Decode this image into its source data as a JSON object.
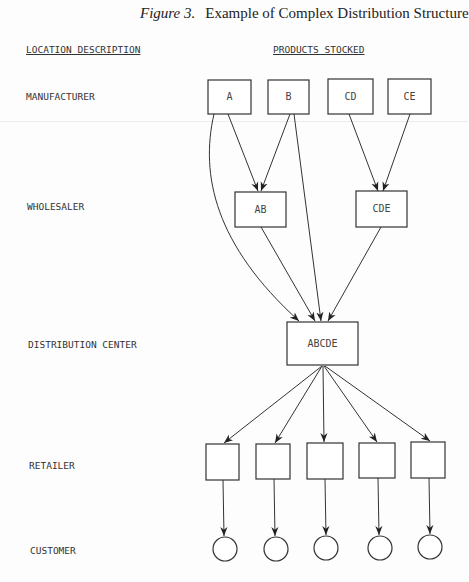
{
  "title": {
    "figure_label": "Figure 3.",
    "text": "Example of Complex Distribution Structure"
  },
  "headers": {
    "location": "LOCATION DESCRIPTION",
    "products": "PRODUCTS STOCKED"
  },
  "levels": [
    {
      "id": "manufacturer",
      "label": "MANUFACTURER"
    },
    {
      "id": "wholesaler",
      "label": "WHOLESALER"
    },
    {
      "id": "distribution_center",
      "label": "DISTRIBUTION CENTER"
    },
    {
      "id": "retailer",
      "label": "RETAILER"
    },
    {
      "id": "customer",
      "label": "CUSTOMER"
    }
  ],
  "nodes": {
    "manufacturers": [
      {
        "id": "A",
        "label": "A"
      },
      {
        "id": "B",
        "label": "B"
      },
      {
        "id": "CD",
        "label": "CD"
      },
      {
        "id": "CE",
        "label": "CE"
      }
    ],
    "wholesalers": [
      {
        "id": "AB",
        "label": "AB"
      },
      {
        "id": "CDE",
        "label": "CDE"
      }
    ],
    "distribution_center": {
      "id": "ABCDE",
      "label": "ABCDE"
    },
    "retailers_count": 5,
    "customers_count": 5
  },
  "edges": [
    [
      "A",
      "AB"
    ],
    [
      "B",
      "AB"
    ],
    [
      "A",
      "ABCDE"
    ],
    [
      "B",
      "ABCDE"
    ],
    [
      "CD",
      "CDE"
    ],
    [
      "CE",
      "CDE"
    ],
    [
      "AB",
      "ABCDE"
    ],
    [
      "CDE",
      "ABCDE"
    ],
    [
      "ABCDE",
      "R1"
    ],
    [
      "ABCDE",
      "R2"
    ],
    [
      "ABCDE",
      "R3"
    ],
    [
      "ABCDE",
      "R4"
    ],
    [
      "ABCDE",
      "R5"
    ],
    [
      "R1",
      "C1"
    ],
    [
      "R2",
      "C2"
    ],
    [
      "R3",
      "C3"
    ],
    [
      "R4",
      "C4"
    ],
    [
      "R5",
      "C5"
    ]
  ]
}
